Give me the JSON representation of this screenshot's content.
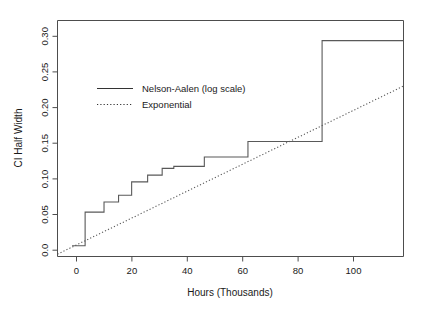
{
  "chart_data": {
    "type": "line",
    "title": "",
    "xlabel": "Hours (Thousands)",
    "ylabel": "CI Half Width",
    "xlim": [
      -5,
      114
    ],
    "ylim": [
      -0.016,
      0.335
    ],
    "xticks": [
      0,
      20,
      40,
      60,
      80,
      100
    ],
    "xticklabels": [
      "0",
      "20",
      "40",
      "60",
      "80",
      "100"
    ],
    "yticks": [
      0.0,
      0.05,
      0.1,
      0.15,
      0.2,
      0.25,
      0.3
    ],
    "yticklabels": [
      "0.0",
      "0.05",
      "0.10",
      "0.15",
      "0.20",
      "0.25",
      "0.30"
    ],
    "grid": false,
    "legend_position": "upper-left-inside",
    "series": [
      {
        "name": "Nelson-Aalen (log scale)",
        "style": "solid",
        "drawstyle": "steps-post",
        "x": [
          0,
          4.5,
          11.0,
          16.0,
          20.5,
          26.0,
          31.0,
          35.0,
          45.5,
          60.5,
          86.0,
          114.0
        ],
        "y": [
          0.0,
          0.05,
          0.065,
          0.075,
          0.095,
          0.105,
          0.115,
          0.118,
          0.132,
          0.155,
          0.305,
          0.305
        ]
      },
      {
        "name": "Exponential",
        "style": "dotted",
        "drawstyle": "default",
        "x": [
          -5.0,
          114.0
        ],
        "y": [
          -0.0125,
          0.2375
        ]
      }
    ]
  },
  "legend": {
    "entries": [
      {
        "label": "Nelson-Aalen (log scale)",
        "style": "solid"
      },
      {
        "label": "Exponential",
        "style": "dotted"
      }
    ]
  },
  "axes": {
    "x_title": "Hours (Thousands)",
    "y_title": "CI Half Width"
  }
}
